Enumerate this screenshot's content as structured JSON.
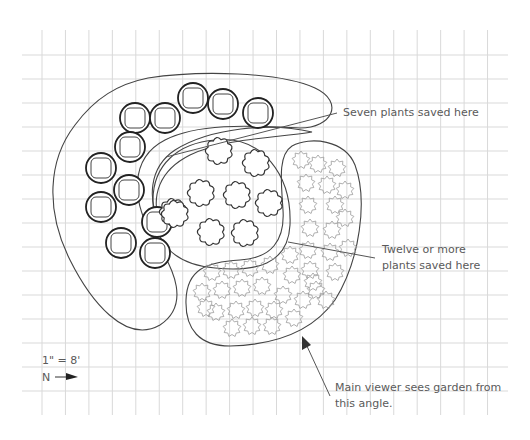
{
  "diagram": {
    "type": "garden-planting-plan",
    "grid": {
      "visible": true,
      "cell_size_px": 23.5,
      "color": "#d9d9d9"
    },
    "scale_label": "1\" = 8'",
    "north_label": "N",
    "north_arrow": "right-arrow",
    "annotations": {
      "seven_plants": "Seven plants saved here",
      "twelve_plants_line1": "Twelve or more",
      "twelve_plants_line2": "plants saved here",
      "viewer_line1": "Main viewer sees garden from",
      "viewer_line2": "this angle."
    },
    "beds": [
      {
        "name": "outer-crescent-bed",
        "plant_symbol": "double-circle-rounded-square",
        "plant_count": 13
      },
      {
        "name": "inner-crescent-bed",
        "plant_symbol": "none",
        "plant_count": 0
      },
      {
        "name": "central-oval-bed",
        "plant_symbol": "bushy-round",
        "plant_count": 9
      },
      {
        "name": "kidney-bed",
        "plant_symbol": "star-outline",
        "plant_count": 40
      }
    ],
    "colors": {
      "line": "#333333",
      "text": "#5a5a5a",
      "light_symbol": "#9a9a9a"
    }
  }
}
